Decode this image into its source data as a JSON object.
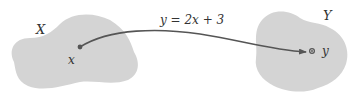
{
  "diagram": {
    "type": "function-mapping",
    "domain_set": {
      "label": "X",
      "fill": "#d4d4d4"
    },
    "codomain_set": {
      "label": "Y",
      "fill": "#d4d4d4"
    },
    "input_point": {
      "label": "x"
    },
    "output_point": {
      "label": "y"
    },
    "mapping": {
      "label": "y = 2x + 3",
      "arrow_color": "#555555"
    }
  }
}
